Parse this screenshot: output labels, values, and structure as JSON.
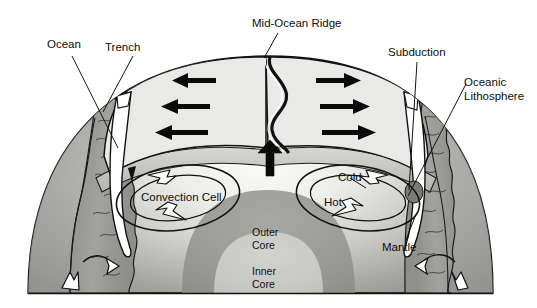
{
  "figure": {
    "type": "cross-section-diagram",
    "width": 537,
    "height": 308,
    "background": "#ffffff"
  },
  "labels": {
    "ocean": "Ocean",
    "trench": "Trench",
    "mid_ocean_ridge": "Mid-Ocean Ridge",
    "subduction": "Subduction",
    "oceanic_lithosphere_line1": "Oceanic",
    "oceanic_lithosphere_line2": "Lithosphere",
    "convection_cell": "Convection Cell",
    "cold": "Cold",
    "hot": "Hot",
    "mantle": "Mantle",
    "outer_core_line1": "Outer",
    "outer_core_line2": "Core",
    "inner_core_line1": "Inner",
    "inner_core_line2": "Core"
  },
  "colors": {
    "lithosphere": "#e9e9e7",
    "mantle_light": "#f2f2f0",
    "mantle_mid": "#bdbdba",
    "mantle_dark": "#8d8d8a",
    "outer_core": "#9a9a97",
    "inner_core": "#c9c9c6",
    "crust_rock": "#9c9c99",
    "crust_rock_dark": "#7e7e7b",
    "outline": "#111111",
    "text": "#0d0d0d",
    "background": "#ffffff"
  },
  "arrows": {
    "spreading_left_count": 3,
    "spreading_right_count": 3,
    "upwelling_count": 1,
    "convection_left_direction": "counterclockwise",
    "convection_right_direction": "clockwise",
    "deep_arrow_count": 4
  }
}
